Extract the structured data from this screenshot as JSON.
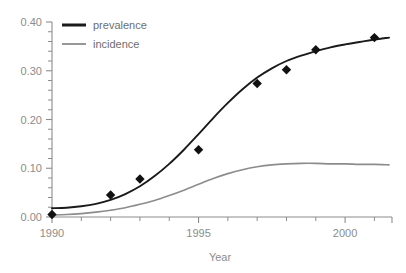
{
  "chart_data": {
    "type": "line",
    "title": "",
    "subtitle": "",
    "xlabel": "Year",
    "ylabel": "",
    "xlim": [
      1990,
      2001.6
    ],
    "ylim": [
      0.0,
      0.4
    ],
    "grid": false,
    "legend_position": "top-left",
    "x_ticks_major": [
      1990,
      1995,
      2000
    ],
    "x_tick_labels": [
      "1990",
      "1995",
      "2000"
    ],
    "x_ticks_minor": [
      1991,
      1992,
      1993,
      1994,
      1996,
      1997,
      1998,
      1999,
      2001
    ],
    "y_ticks_major": [
      0.0,
      0.1,
      0.2,
      0.3,
      0.4
    ],
    "y_tick_labels": [
      "0.00",
      "0.10",
      "0.20",
      "0.30",
      "0.40"
    ],
    "y_ticks_minor": [
      0.02,
      0.04,
      0.06,
      0.08,
      0.12,
      0.14,
      0.16,
      0.18,
      0.22,
      0.24,
      0.26,
      0.28,
      0.32,
      0.34,
      0.36,
      0.38
    ],
    "series": [
      {
        "name": "prevalence",
        "color": "#1a1a1a",
        "line_width": 1.9,
        "marker": "diamond",
        "marker_color": "#111111",
        "marker_size": 7,
        "points": [
          {
            "x": 1990.0,
            "y": 0.005
          },
          {
            "x": 1992.0,
            "y": 0.045
          },
          {
            "x": 1993.0,
            "y": 0.078
          },
          {
            "x": 1995.0,
            "y": 0.138
          },
          {
            "x": 1997.0,
            "y": 0.274
          },
          {
            "x": 1998.0,
            "y": 0.302
          },
          {
            "x": 1999.0,
            "y": 0.343
          },
          {
            "x": 2001.0,
            "y": 0.368
          }
        ],
        "curve": [
          {
            "x": 1990.0,
            "y": 0.018
          },
          {
            "x": 1990.5,
            "y": 0.019
          },
          {
            "x": 1991.0,
            "y": 0.022
          },
          {
            "x": 1991.5,
            "y": 0.027
          },
          {
            "x": 1992.0,
            "y": 0.035
          },
          {
            "x": 1992.5,
            "y": 0.047
          },
          {
            "x": 1993.0,
            "y": 0.063
          },
          {
            "x": 1993.5,
            "y": 0.084
          },
          {
            "x": 1994.0,
            "y": 0.109
          },
          {
            "x": 1994.5,
            "y": 0.138
          },
          {
            "x": 1995.0,
            "y": 0.17
          },
          {
            "x": 1995.5,
            "y": 0.203
          },
          {
            "x": 1996.0,
            "y": 0.234
          },
          {
            "x": 1996.5,
            "y": 0.262
          },
          {
            "x": 1997.0,
            "y": 0.286
          },
          {
            "x": 1997.5,
            "y": 0.305
          },
          {
            "x": 1998.0,
            "y": 0.32
          },
          {
            "x": 1998.5,
            "y": 0.331
          },
          {
            "x": 1999.0,
            "y": 0.34
          },
          {
            "x": 1999.5,
            "y": 0.348
          },
          {
            "x": 2000.0,
            "y": 0.354
          },
          {
            "x": 2000.5,
            "y": 0.359
          },
          {
            "x": 2001.0,
            "y": 0.364
          },
          {
            "x": 2001.5,
            "y": 0.368
          }
        ]
      },
      {
        "name": "incidence",
        "color": "#8c8c8c",
        "line_width": 1.6,
        "marker": "none",
        "points": [],
        "curve": [
          {
            "x": 1990.0,
            "y": 0.004
          },
          {
            "x": 1990.5,
            "y": 0.005
          },
          {
            "x": 1991.0,
            "y": 0.007
          },
          {
            "x": 1991.5,
            "y": 0.01
          },
          {
            "x": 1992.0,
            "y": 0.014
          },
          {
            "x": 1992.5,
            "y": 0.019
          },
          {
            "x": 1993.0,
            "y": 0.026
          },
          {
            "x": 1993.5,
            "y": 0.034
          },
          {
            "x": 1994.0,
            "y": 0.044
          },
          {
            "x": 1994.5,
            "y": 0.055
          },
          {
            "x": 1995.0,
            "y": 0.067
          },
          {
            "x": 1995.5,
            "y": 0.079
          },
          {
            "x": 1996.0,
            "y": 0.089
          },
          {
            "x": 1996.5,
            "y": 0.097
          },
          {
            "x": 1997.0,
            "y": 0.103
          },
          {
            "x": 1997.5,
            "y": 0.107
          },
          {
            "x": 1998.0,
            "y": 0.109
          },
          {
            "x": 1998.5,
            "y": 0.11
          },
          {
            "x": 1999.0,
            "y": 0.11
          },
          {
            "x": 1999.5,
            "y": 0.109
          },
          {
            "x": 2000.0,
            "y": 0.109
          },
          {
            "x": 2000.5,
            "y": 0.108
          },
          {
            "x": 2001.0,
            "y": 0.108
          },
          {
            "x": 2001.5,
            "y": 0.107
          }
        ]
      }
    ]
  },
  "legend": {
    "entries": [
      {
        "label": "prevalence",
        "color": "#1a1a1a",
        "width": 3.0
      },
      {
        "label": "incidence",
        "color": "#8c8c8c",
        "width": 1.8
      }
    ]
  },
  "axes": {
    "x_title": "Year",
    "axis_color": "#8c8c8c"
  }
}
